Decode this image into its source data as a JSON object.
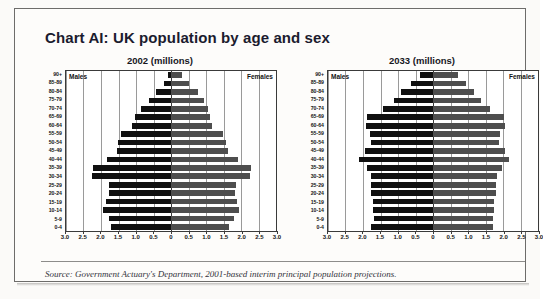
{
  "document": {
    "title": "Chart AI: UK population by age and sex",
    "source": "Source: Government Actuary's Department, 2001-based interim principal population projections."
  },
  "legend": {
    "males_label": "Males",
    "females_label": "Females"
  },
  "axis": {
    "tick_labels": [
      "3.0",
      "2.5",
      "2.0",
      "1.5",
      "1.0",
      "0.5",
      "0",
      "0.5",
      "1.0",
      "1.5",
      "2.0",
      "2.5",
      "3.0"
    ],
    "tick_values": [
      -3.0,
      -2.5,
      -2.0,
      -1.5,
      -1.0,
      -0.5,
      0,
      0.5,
      1.0,
      1.5,
      2.0,
      2.5,
      3.0
    ],
    "min": -3.0,
    "max": 3.0,
    "age_groups": [
      "90+",
      "85-89",
      "80-84",
      "75-79",
      "70-74",
      "65-69",
      "60-64",
      "55-59",
      "50-54",
      "45-49",
      "40-44",
      "35-39",
      "30-34",
      "25-29",
      "20-24",
      "15-19",
      "10-14",
      "5-9",
      "0-4"
    ]
  },
  "colors": {
    "male_bar": "#101010",
    "female_bar": "#4e4e4e",
    "gridline": "#9a9a9a",
    "axis": "#3a3a3a",
    "frame": "#6d6c6a",
    "page": "#fdfcfa",
    "title_text": "#1b1b2e"
  },
  "chart_data": [
    {
      "type": "bar",
      "subtype": "population-pyramid",
      "title": "2002 (millions)",
      "xlabel": "",
      "ylabel": "",
      "xlim": [
        -3.0,
        3.0
      ],
      "grid": true,
      "legend_position": "inside-top-corners",
      "categories": [
        "90+",
        "85-89",
        "80-84",
        "75-79",
        "70-74",
        "65-69",
        "60-64",
        "55-59",
        "50-54",
        "45-49",
        "40-44",
        "35-39",
        "30-34",
        "25-29",
        "20-24",
        "15-19",
        "10-14",
        "5-9",
        "0-4"
      ],
      "series": [
        {
          "name": "Males",
          "side": "left",
          "values": [
            0.08,
            0.21,
            0.42,
            0.62,
            0.87,
            1.02,
            1.12,
            1.42,
            1.52,
            1.55,
            1.82,
            2.22,
            2.25,
            1.78,
            1.78,
            1.85,
            1.95,
            1.78,
            1.72
          ]
        },
        {
          "name": "Females",
          "side": "right",
          "values": [
            0.31,
            0.52,
            0.78,
            0.95,
            1.05,
            1.12,
            1.18,
            1.48,
            1.58,
            1.62,
            1.9,
            2.28,
            2.25,
            1.85,
            1.82,
            1.88,
            1.95,
            1.8,
            1.65
          ]
        }
      ]
    },
    {
      "type": "bar",
      "subtype": "population-pyramid",
      "title": "2033 (millions)",
      "xlabel": "",
      "ylabel": "",
      "xlim": [
        -3.0,
        3.0
      ],
      "grid": true,
      "legend_position": "inside-top-corners",
      "categories": [
        "90+",
        "85-89",
        "80-84",
        "75-79",
        "70-74",
        "65-69",
        "60-64",
        "55-59",
        "50-54",
        "45-49",
        "40-44",
        "35-39",
        "30-34",
        "25-29",
        "20-24",
        "15-19",
        "10-14",
        "5-9",
        "0-4"
      ],
      "series": [
        {
          "name": "Males",
          "side": "left",
          "values": [
            0.38,
            0.62,
            0.92,
            1.12,
            1.42,
            1.88,
            1.92,
            1.8,
            1.78,
            1.95,
            2.12,
            1.88,
            1.78,
            1.78,
            1.78,
            1.72,
            1.72,
            1.7,
            1.78
          ]
        },
        {
          "name": "Females",
          "side": "right",
          "values": [
            0.72,
            0.95,
            1.18,
            1.38,
            1.62,
            2.02,
            2.05,
            1.92,
            1.88,
            2.05,
            2.18,
            1.98,
            1.82,
            1.8,
            1.8,
            1.75,
            1.75,
            1.72,
            1.72
          ]
        }
      ]
    }
  ]
}
